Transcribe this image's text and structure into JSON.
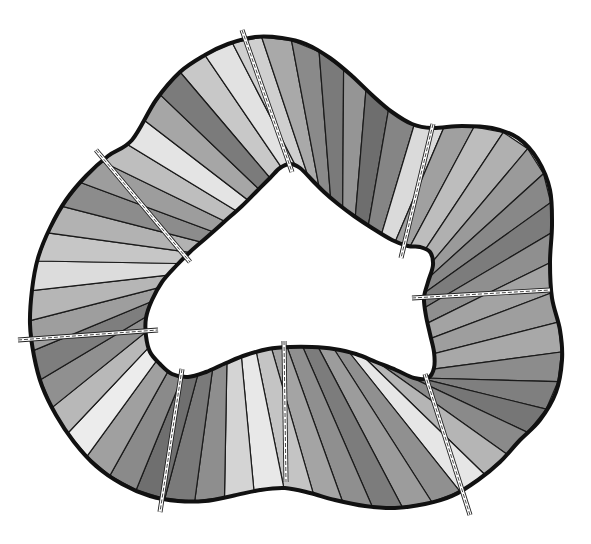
{
  "header": {
    "partial_glyph": "p"
  },
  "diagram": {
    "title": "",
    "outer": [
      [
        180,
        72
      ],
      [
        205,
        55
      ],
      [
        228,
        44
      ],
      [
        255,
        37
      ],
      [
        282,
        38
      ],
      [
        306,
        44
      ],
      [
        330,
        58
      ],
      [
        352,
        76
      ],
      [
        372,
        95
      ],
      [
        392,
        112
      ],
      [
        412,
        124
      ],
      [
        432,
        128
      ],
      [
        462,
        126
      ],
      [
        492,
        128
      ],
      [
        518,
        138
      ],
      [
        538,
        160
      ],
      [
        550,
        190
      ],
      [
        552,
        225
      ],
      [
        550,
        262
      ],
      [
        552,
        298
      ],
      [
        560,
        330
      ],
      [
        562,
        360
      ],
      [
        556,
        392
      ],
      [
        540,
        420
      ],
      [
        520,
        440
      ],
      [
        500,
        462
      ],
      [
        478,
        480
      ],
      [
        452,
        496
      ],
      [
        425,
        504
      ],
      [
        395,
        508
      ],
      [
        365,
        506
      ],
      [
        335,
        500
      ],
      [
        310,
        493
      ],
      [
        285,
        488
      ],
      [
        260,
        490
      ],
      [
        232,
        496
      ],
      [
        205,
        501
      ],
      [
        178,
        501
      ],
      [
        150,
        496
      ],
      [
        122,
        484
      ],
      [
        96,
        466
      ],
      [
        74,
        442
      ],
      [
        56,
        415
      ],
      [
        42,
        386
      ],
      [
        34,
        356
      ],
      [
        30,
        324
      ],
      [
        32,
        290
      ],
      [
        38,
        258
      ],
      [
        50,
        228
      ],
      [
        66,
        200
      ],
      [
        86,
        176
      ],
      [
        108,
        156
      ],
      [
        132,
        140
      ],
      [
        156,
        100
      ]
    ],
    "inner": [
      [
        270,
        178
      ],
      [
        280,
        168
      ],
      [
        290,
        164
      ],
      [
        300,
        168
      ],
      [
        312,
        180
      ],
      [
        324,
        192
      ],
      [
        338,
        204
      ],
      [
        354,
        216
      ],
      [
        372,
        228
      ],
      [
        392,
        240
      ],
      [
        408,
        246
      ],
      [
        420,
        247
      ],
      [
        430,
        252
      ],
      [
        433,
        265
      ],
      [
        428,
        282
      ],
      [
        424,
        298
      ],
      [
        426,
        316
      ],
      [
        430,
        334
      ],
      [
        434,
        352
      ],
      [
        434,
        368
      ],
      [
        428,
        378
      ],
      [
        414,
        378
      ],
      [
        396,
        370
      ],
      [
        376,
        362
      ],
      [
        356,
        354
      ],
      [
        334,
        349
      ],
      [
        312,
        347
      ],
      [
        290,
        347
      ],
      [
        268,
        349
      ],
      [
        246,
        355
      ],
      [
        226,
        363
      ],
      [
        206,
        372
      ],
      [
        188,
        377
      ],
      [
        172,
        374
      ],
      [
        160,
        364
      ],
      [
        150,
        352
      ],
      [
        146,
        336
      ],
      [
        146,
        318
      ],
      [
        152,
        300
      ],
      [
        162,
        282
      ],
      [
        176,
        266
      ],
      [
        190,
        252
      ],
      [
        206,
        238
      ],
      [
        224,
        222
      ],
      [
        242,
        206
      ],
      [
        256,
        192
      ]
    ],
    "shades": [
      "#c8c8c8",
      "#e2e2e2",
      "#cfcfcf",
      "#a9a9a9",
      "#8a8a8a",
      "#7a7a7a",
      "#959595",
      "#6e6e6e",
      "#858585",
      "#dadada",
      "#a0a0a0",
      "#bdbdbd",
      "#b0b0b0",
      "#9a9a9a",
      "#888888",
      "#7c7c7c",
      "#8f8f8f",
      "#a3a3a3",
      "#9e9e9e",
      "#a8a8a8",
      "#8c8c8c",
      "#7f7f7f",
      "#767676",
      "#8a8a8a",
      "#b5b5b5",
      "#e6e6e6",
      "#909090",
      "#9c9c9c",
      "#7c7c7c",
      "#8f8f8f",
      "#a4a4a4",
      "#c4c4c4",
      "#e8e8e8",
      "#d4d4d4",
      "#8e8e8e",
      "#7a7a7a",
      "#6f6f6f",
      "#8a8a8a",
      "#a0a0a0",
      "#ececec",
      "#b8b8b8",
      "#909090",
      "#7e7e7e",
      "#9e9e9e",
      "#b6b6b6",
      "#dcdcdc",
      "#c6c6c6",
      "#b2b2b2",
      "#8c8c8c",
      "#9d9d9d",
      "#bebebe",
      "#e4e4e4",
      "#a6a6a6",
      "#7b7b7b"
    ],
    "seams": [
      {
        "x1": 242,
        "y1": 30,
        "x2": 292,
        "y2": 172
      },
      {
        "x1": 433,
        "y1": 124,
        "x2": 401,
        "y2": 258
      },
      {
        "x1": 412,
        "y1": 298,
        "x2": 550,
        "y2": 290
      },
      {
        "x1": 425,
        "y1": 374,
        "x2": 470,
        "y2": 515
      },
      {
        "x1": 284,
        "y1": 341,
        "x2": 286,
        "y2": 482
      },
      {
        "x1": 182,
        "y1": 369,
        "x2": 160,
        "y2": 512
      },
      {
        "x1": 18,
        "y1": 340,
        "x2": 158,
        "y2": 330
      },
      {
        "x1": 96,
        "y1": 150,
        "x2": 190,
        "y2": 262
      }
    ],
    "colors": {
      "outline": "#111111",
      "seam": "#ffffff",
      "background": "#ffffff"
    }
  }
}
